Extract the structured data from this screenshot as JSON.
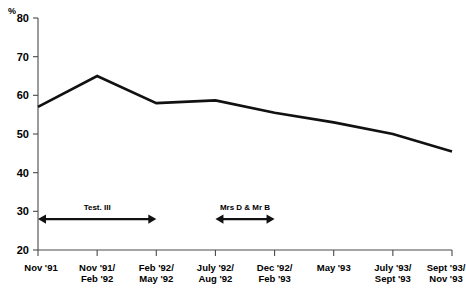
{
  "chart_data": {
    "type": "line",
    "title": "",
    "subtitle": "",
    "xlabel": "",
    "ylabel": "%",
    "ylim": [
      20,
      80
    ],
    "ytick_step": 10,
    "yticks": [
      "80",
      "70",
      "60",
      "50",
      "40",
      "30",
      "20"
    ],
    "grid": false,
    "legend": "none",
    "categories": [
      "Nov '91",
      "Nov '91/\nFeb '92",
      "Feb '92/\nMay '92",
      "July '92/\nAug '92",
      "Dec '92/\nFeb '93",
      "May '93",
      "July '93/\nSept '93",
      "Sept '93/\nNov '93"
    ],
    "category_lines": [
      [
        "Nov '91",
        ""
      ],
      [
        "Nov '91/",
        "Feb '92"
      ],
      [
        "Feb '92/",
        "May '92"
      ],
      [
        "July '92/",
        "Aug '92"
      ],
      [
        "Dec '92/",
        "Feb '93"
      ],
      [
        "May '93",
        ""
      ],
      [
        "July '93/",
        "Sept '93"
      ],
      [
        "Sept '93/",
        "Nov '93"
      ]
    ],
    "values": [
      57,
      65,
      58,
      58.7,
      55.5,
      53,
      50,
      45.5
    ],
    "series": [
      {
        "name": "",
        "values": [
          57,
          65,
          58,
          58.7,
          55.5,
          53,
          50,
          45.5
        ]
      }
    ],
    "annotations": [
      {
        "label": "Test. III",
        "span_start_category": "Nov '91",
        "span_end_category": "Feb '92/\nMay '92",
        "value_at": 28
      },
      {
        "label": "Mrs D & Mr B",
        "span_start_category": "July '92/\nAug '92",
        "span_end_category": "Dec '92/\nFeb '93",
        "value_at": 28
      }
    ],
    "colors": {
      "line": "#111111",
      "axis": "#4a4a4a",
      "text": "#000000",
      "background": "#ffffff"
    }
  }
}
